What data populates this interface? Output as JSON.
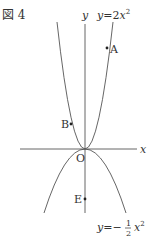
{
  "figure": {
    "title": "図 4",
    "axes": {
      "x_label": "x",
      "y_label": "y",
      "origin_label": "O"
    },
    "curves": [
      {
        "name": "upper-parabola",
        "label": "y = 2x²",
        "label_prefix": "y = 2",
        "var": "x",
        "exp": "2"
      },
      {
        "name": "lower-parabola",
        "label": "y = −½x²",
        "label_prefix": "y = −",
        "frac_num": "1",
        "frac_den": "2",
        "var": "x",
        "exp": "2"
      }
    ],
    "points": [
      {
        "label": "A",
        "on": "y = 2x²"
      },
      {
        "label": "B",
        "on": "y = 2x²"
      },
      {
        "label": "E",
        "on": "y-axis"
      }
    ],
    "colors": {
      "line": "#555555",
      "text": "#333333"
    }
  }
}
